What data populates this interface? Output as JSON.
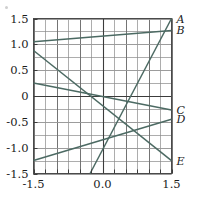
{
  "chart_data": {
    "type": "line",
    "title": "",
    "xlabel": "",
    "ylabel": "",
    "xlim": [
      -1.5,
      1.5
    ],
    "ylim": [
      -1.5,
      1.5
    ],
    "grid": true,
    "grid_major_step": 0.5,
    "grid_minor_step": 0.25,
    "legend_position": "right-edge-labels",
    "line_color": "#4c6a63",
    "xticks": [
      -1.5,
      0.0,
      1.5
    ],
    "xtick_labels": [
      "-1.5",
      "0.0",
      "1.5"
    ],
    "yticks": [
      -1.5,
      -1.0,
      -0.5,
      0,
      0.5,
      1.0,
      1.5
    ],
    "ytick_labels": [
      "-1.5",
      "-1.0",
      "-0.5",
      "0",
      "0.5",
      "1.0",
      "1.5"
    ],
    "series": [
      {
        "name": "A",
        "label": "A",
        "x": [
          -0.27,
          1.5
        ],
        "y": [
          -1.5,
          1.5
        ],
        "slope": 1.695,
        "intercept": -1.042
      },
      {
        "name": "B",
        "label": "B",
        "x": [
          -1.5,
          1.5
        ],
        "y": [
          1.05,
          1.27
        ],
        "slope": 0.0733,
        "intercept": 1.16
      },
      {
        "name": "C",
        "label": "C",
        "x": [
          -1.5,
          1.5
        ],
        "y": [
          0.25,
          -0.27
        ],
        "slope": -0.1733,
        "intercept": -0.01
      },
      {
        "name": "D",
        "label": "D",
        "x": [
          -1.5,
          1.5
        ],
        "y": [
          -1.25,
          -0.45
        ],
        "slope": 0.2667,
        "intercept": -0.85
      },
      {
        "name": "E",
        "label": "E",
        "x": [
          -1.5,
          1.5
        ],
        "y": [
          0.88,
          -1.25
        ],
        "slope": -0.71,
        "intercept": -0.185
      }
    ]
  },
  "axes": {
    "x_tick_labels": [
      "-1.5",
      "0.0",
      "1.5"
    ],
    "y_tick_labels": [
      "1.5",
      "1.0",
      "0.5",
      "0",
      "-0.5",
      "-1.0",
      "-1.5"
    ]
  },
  "series_labels": {
    "a": "A",
    "b": "B",
    "c": "C",
    "d": "D",
    "e": "E"
  }
}
